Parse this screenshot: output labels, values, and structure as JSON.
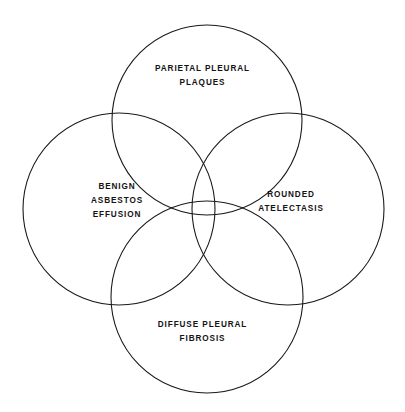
{
  "diagram": {
    "type": "venn",
    "background_color": "#ffffff",
    "stroke_color": "#1a1a1a",
    "stroke_width": 1.1,
    "text_color": "#141414",
    "sets": [
      {
        "id": "parietal-pleural-plaques",
        "position": "top",
        "lines": [
          "PARIETAL PLEURAL",
          "PLAQUES"
        ],
        "center_x": 207,
        "center_y": 120,
        "radius": 95
      },
      {
        "id": "benign-asbestos-effusion",
        "position": "left",
        "lines": [
          "BENIGN",
          "ASBESTOS",
          "EFFUSION"
        ],
        "center_x": 119,
        "center_y": 209,
        "radius": 96
      },
      {
        "id": "rounded-atelectasis",
        "position": "right",
        "lines": [
          "ROUNDED",
          "ATELECTASIS"
        ],
        "center_x": 288,
        "center_y": 209,
        "radius": 96
      },
      {
        "id": "diffuse-pleural-fibrosis",
        "position": "bottom",
        "lines": [
          "DIFFUSE PLEURAL",
          "FIBROSIS"
        ],
        "center_x": 207,
        "center_y": 297,
        "radius": 96
      }
    ]
  }
}
